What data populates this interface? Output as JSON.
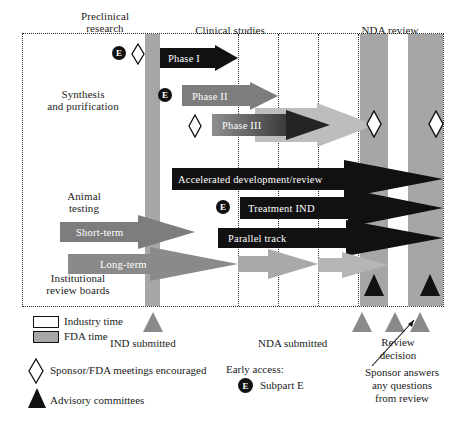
{
  "figure": {
    "colors": {
      "fda_time": "#a6a6a6",
      "industry_time": "#ffffff",
      "black_arrow": "#111111",
      "grey_arrow": "#7d7d7d",
      "light_arrow": "#b9b9b9",
      "frame": "#2a2a2a"
    }
  },
  "top_headers": [
    {
      "label": "Preclinical\nresearch"
    },
    {
      "label": "Clinical studies"
    },
    {
      "label": "NDA review"
    }
  ],
  "left_labels": [
    {
      "label": "Synthesis\nand purification"
    },
    {
      "label": "Animal\ntesting"
    },
    {
      "label": "Institutional\nreview boards"
    }
  ],
  "phase_arrows": [
    {
      "label": "Phase I",
      "style": "black"
    },
    {
      "label": "Phase II",
      "style": "grey"
    },
    {
      "label": "Phase III",
      "style": "grey-gradient"
    },
    {
      "label": "Accelerated development/review",
      "style": "black"
    },
    {
      "label": "Treatment IND",
      "style": "black"
    },
    {
      "label": "Parallel track",
      "style": "black"
    },
    {
      "label": "Short-term",
      "style": "grey"
    },
    {
      "label": "Long-term",
      "style": "grey"
    }
  ],
  "legend": {
    "industry_time": "Industry time",
    "fda_time": "FDA time",
    "sponsor_meetings": "Sponsor/FDA meetings encouraged",
    "advisory_committees": "Advisory committees",
    "early_access_header": "Early access:",
    "subpart_e": "Subpart E",
    "subpart_e_marker": "E"
  },
  "milestones": [
    {
      "label": "IND submitted"
    },
    {
      "label": "NDA submitted"
    },
    {
      "label": "Review\ndecision"
    }
  ],
  "annotation": {
    "text": "Sponsor answers\nany questions\nfrom review"
  },
  "icons": {
    "diamond": "sponsor-meeting-diamond-icon",
    "triangle": "advisory-committee-triangle-icon",
    "e_marker": "subpart-e-icon"
  }
}
